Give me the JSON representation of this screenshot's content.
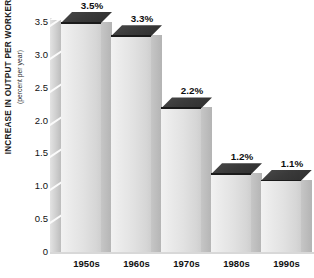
{
  "chart_data": {
    "type": "bar",
    "title": "",
    "subtitle": "",
    "xlabel": "",
    "ylabel": "INCREASE IN OUTPUT PER WORKER",
    "ylabel_sub": "(percent per year)",
    "categories": [
      "1950s",
      "1960s",
      "1970s",
      "1980s",
      "1990s"
    ],
    "values": [
      3.5,
      3.3,
      2.2,
      1.2,
      1.1
    ],
    "value_labels": [
      "3.5%",
      "3.3%",
      "2.2%",
      "1.2%",
      "1.1%"
    ],
    "ylim": [
      0,
      3.75
    ],
    "yticks": [
      0,
      0.5,
      1.0,
      1.5,
      2.0,
      2.5,
      3.0,
      3.5
    ],
    "ytick_labels": [
      "0",
      "0.5",
      "1.0",
      "1.5",
      "2.0",
      "2.5",
      "3.0",
      "3.5"
    ],
    "grid": false,
    "legend": false,
    "style": "3d-isometric-bars",
    "colors": {
      "bar_face_light": "#f2f2f2",
      "bar_face_dark": "#cfcfcf",
      "bar_side": "#bcbcbc",
      "bar_top": "#3a3a3a",
      "background": "#ffffff",
      "wall": "#cfcfcf",
      "text": "#111111"
    }
  }
}
